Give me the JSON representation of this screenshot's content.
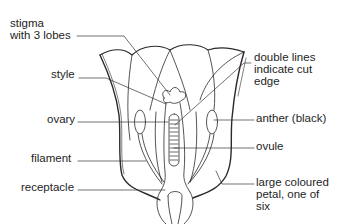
{
  "diagram": {
    "labels": {
      "stigma": {
        "line1": "stigma",
        "line2": "with 3 lobes"
      },
      "style": "style",
      "ovary": "ovary",
      "filament": "filament",
      "receptacle": "receptacle",
      "double_lines": {
        "line1": "double lines",
        "line2": "indicate cut",
        "line3": "edge"
      },
      "anther": "anther (black)",
      "ovule": "ovule",
      "petal": {
        "line1": "large coloured",
        "line2": "petal, one of",
        "line3": "six"
      }
    },
    "colors": {
      "line": "#2a2a2a",
      "text": "#1e1e1e",
      "background": "#ffffff"
    }
  }
}
